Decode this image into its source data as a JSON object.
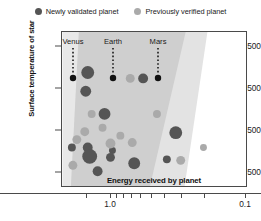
{
  "legend": {
    "entries": [
      {
        "label": "Newly validated planet",
        "color": "#555555",
        "icon": "filled-circle-icon"
      },
      {
        "label": "Previously verified planet",
        "color": "#aaaaaa",
        "icon": "filled-circle-icon"
      }
    ]
  },
  "chart_data": {
    "type": "scatter",
    "title": "",
    "xlabel": "Energy received by planet",
    "ylabel": "Surface temperature of star",
    "xscale": "log",
    "x_reversed": true,
    "xlim": [
      1.6,
      0.085
    ],
    "ylim": [
      3050,
      6850
    ],
    "xticks": [
      1.5,
      1.0,
      0.9,
      0.8,
      0.7,
      0.6,
      0.5,
      0.4,
      0.3,
      0.2,
      0.1
    ],
    "xtick_labels": [
      "",
      "1.0",
      "",
      "",
      "",
      "",
      "",
      "",
      "",
      "",
      "0.1"
    ],
    "yticks": [
      3500,
      4500,
      5500,
      6500
    ],
    "ytick_labels": [
      "3500",
      "4500",
      "5500",
      "6500"
    ],
    "grid": false,
    "legend_position": "top-center",
    "bands": [
      {
        "name": "optimistic-habitable-zone",
        "color": "#e3e3e3"
      },
      {
        "name": "conservative-habitable-zone",
        "color": "#cfcfcf"
      }
    ],
    "annotations": [
      {
        "label": "Venus",
        "energy": 1.91,
        "temperature": 5778,
        "px": 73,
        "py": 78
      },
      {
        "label": "Earth",
        "energy": 1.0,
        "temperature": 5778,
        "px": 113,
        "py": 78
      },
      {
        "label": "Mars",
        "energy": 0.43,
        "temperature": 5778,
        "px": 158,
        "py": 78
      }
    ],
    "series": [
      {
        "name": "Newly validated planet",
        "color": "#555555",
        "points": [
          {
            "px": 87,
            "py": 72,
            "r": 6.5
          },
          {
            "px": 143,
            "py": 78,
            "r": 5.0
          },
          {
            "px": 85,
            "py": 91,
            "r": 5.5
          },
          {
            "px": 104,
            "py": 114,
            "r": 6.0
          },
          {
            "px": 176,
            "py": 133,
            "r": 6.5
          },
          {
            "px": 87,
            "py": 148,
            "r": 5.0
          },
          {
            "px": 112,
            "py": 151,
            "r": 3.5
          },
          {
            "px": 89,
            "py": 155,
            "r": 3.0
          },
          {
            "px": 89,
            "py": 157,
            "r": 7.5
          },
          {
            "px": 110,
            "py": 158,
            "r": 4.5
          },
          {
            "px": 134,
            "py": 164,
            "r": 6.0
          },
          {
            "px": 167,
            "py": 160,
            "r": 4.0
          },
          {
            "px": 97,
            "py": 172,
            "r": 5.0
          },
          {
            "px": 71,
            "py": 148,
            "r": 4.0
          }
        ]
      },
      {
        "name": "Previously verified planet",
        "color": "#aaaaaa",
        "points": [
          {
            "px": 130,
            "py": 78,
            "r": 4.5
          },
          {
            "px": 91,
            "py": 114,
            "r": 4.0
          },
          {
            "px": 157,
            "py": 114,
            "r": 4.0
          },
          {
            "px": 84,
            "py": 132,
            "r": 4.5
          },
          {
            "px": 102,
            "py": 128,
            "r": 4.0
          },
          {
            "px": 120,
            "py": 136,
            "r": 4.0
          },
          {
            "px": 76,
            "py": 140,
            "r": 4.5
          },
          {
            "px": 110,
            "py": 144,
            "r": 5.0
          },
          {
            "px": 132,
            "py": 143,
            "r": 4.5
          },
          {
            "px": 72,
            "py": 166,
            "r": 4.5
          },
          {
            "px": 181,
            "py": 161,
            "r": 4.5
          },
          {
            "px": 204,
            "py": 148,
            "r": 3.5
          }
        ]
      }
    ]
  }
}
